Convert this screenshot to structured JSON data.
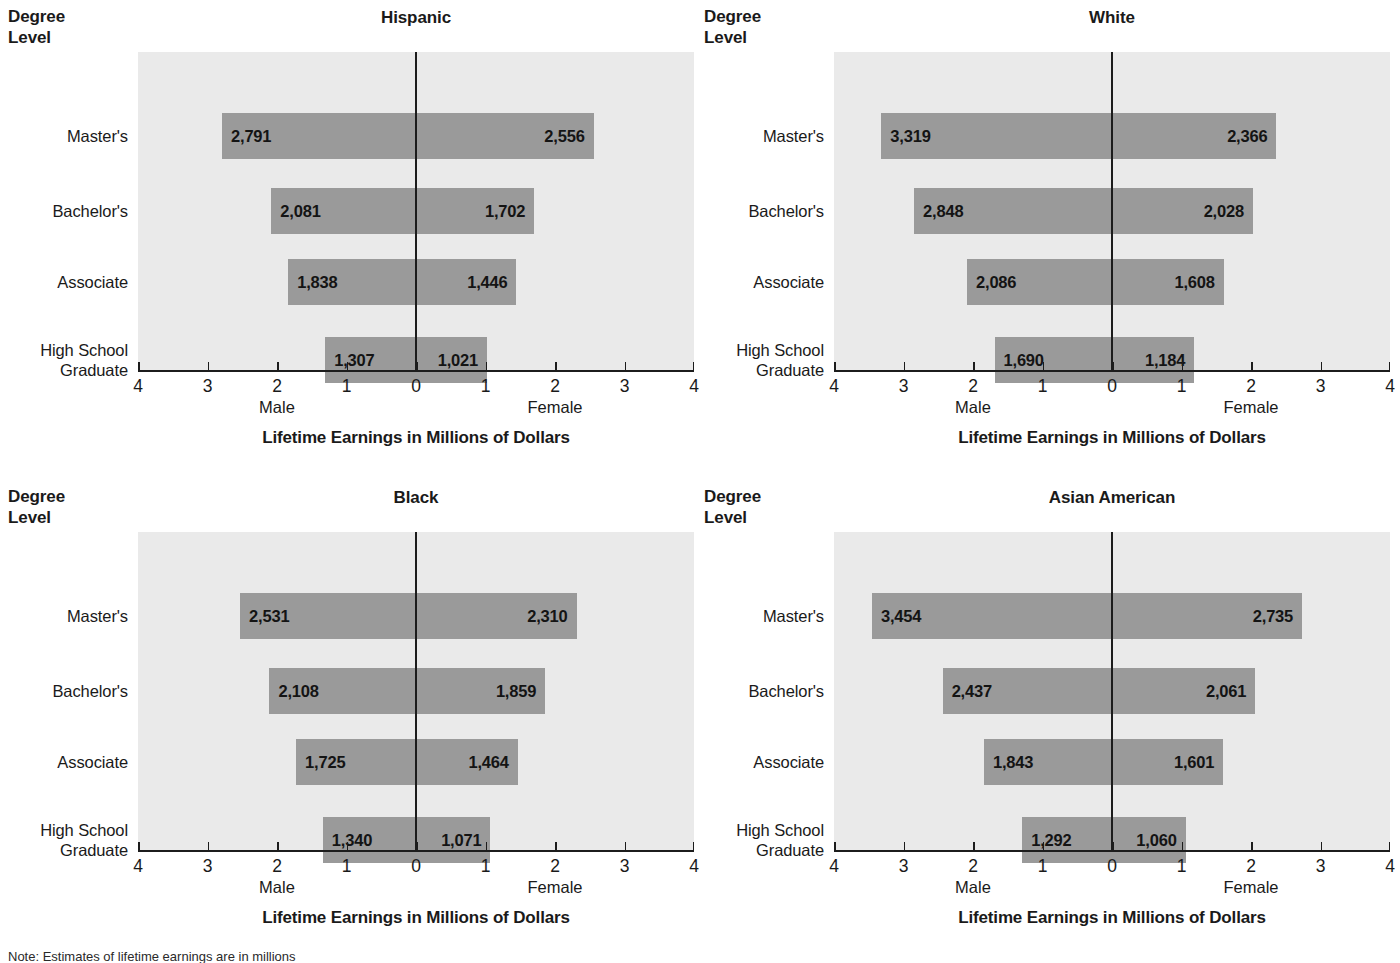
{
  "figure": {
    "stub_head_line1": "Degree",
    "stub_head_line2": "Level",
    "axis_title": "Lifetime Earnings in Millions of Dollars",
    "male_label": "Male",
    "female_label": "Female",
    "footnote": "Note: Estimates of lifetime earnings are in millions",
    "bar_color": "#9a9a9a",
    "plot_background": "#eaeaea",
    "axis_color": "#1c1c1c",
    "text_color": "#1a1a1a"
  },
  "axis": {
    "tick_labels": [
      "4",
      "3",
      "2",
      "1",
      "0",
      "1",
      "2",
      "3",
      "4"
    ],
    "tick_values": [
      -4,
      -3,
      -2,
      -1,
      0,
      1,
      2,
      3,
      4
    ],
    "min": -4,
    "max": 4
  },
  "categories": [
    {
      "label_line1": "Master's",
      "label_line2": ""
    },
    {
      "label_line1": "Bachelor's",
      "label_line2": ""
    },
    {
      "label_line1": "Associate",
      "label_line2": ""
    },
    {
      "label_line1": "High School",
      "label_line2": "Graduate"
    }
  ],
  "panels": [
    {
      "title": "Hispanic",
      "rows": [
        {
          "category": "Master's",
          "male_label": "2,791",
          "female_label": "2,556",
          "male": 2.791,
          "female": 2.556
        },
        {
          "category": "Bachelor's",
          "male_label": "2,081",
          "female_label": "1,702",
          "male": 2.081,
          "female": 1.702
        },
        {
          "category": "Associate",
          "male_label": "1,838",
          "female_label": "1,446",
          "male": 1.838,
          "female": 1.446
        },
        {
          "category": "High School Graduate",
          "male_label": "1,307",
          "female_label": "1,021",
          "male": 1.307,
          "female": 1.021
        }
      ]
    },
    {
      "title": "White",
      "rows": [
        {
          "category": "Master's",
          "male_label": "3,319",
          "female_label": "2,366",
          "male": 3.319,
          "female": 2.366
        },
        {
          "category": "Bachelor's",
          "male_label": "2,848",
          "female_label": "2,028",
          "male": 2.848,
          "female": 2.028
        },
        {
          "category": "Associate",
          "male_label": "2,086",
          "female_label": "1,608",
          "male": 2.086,
          "female": 1.608
        },
        {
          "category": "High School Graduate",
          "male_label": "1,690",
          "female_label": "1,184",
          "male": 1.69,
          "female": 1.184
        }
      ]
    },
    {
      "title": "Black",
      "rows": [
        {
          "category": "Master's",
          "male_label": "2,531",
          "female_label": "2,310",
          "male": 2.531,
          "female": 2.31
        },
        {
          "category": "Bachelor's",
          "male_label": "2,108",
          "female_label": "1,859",
          "male": 2.108,
          "female": 1.859
        },
        {
          "category": "Associate",
          "male_label": "1,725",
          "female_label": "1,464",
          "male": 1.725,
          "female": 1.464
        },
        {
          "category": "High School Graduate",
          "male_label": "1,340",
          "female_label": "1,071",
          "male": 1.34,
          "female": 1.071
        }
      ]
    },
    {
      "title": "Asian American",
      "rows": [
        {
          "category": "Master's",
          "male_label": "3,454",
          "female_label": "2,735",
          "male": 3.454,
          "female": 2.735
        },
        {
          "category": "Bachelor's",
          "male_label": "2,437",
          "female_label": "2,061",
          "male": 2.437,
          "female": 2.061
        },
        {
          "category": "Associate",
          "male_label": "1,843",
          "female_label": "1,601",
          "male": 1.843,
          "female": 1.601
        },
        {
          "category": "High School Graduate",
          "male_label": "1,292",
          "female_label": "1,060",
          "male": 1.292,
          "female": 1.06
        }
      ]
    }
  ],
  "chart_data": {
    "type": "bar",
    "subtitle": "",
    "xlabel": "Lifetime Earnings in Millions of Dollars",
    "ylabel": "Degree Level",
    "orientation": "horizontal",
    "layout": "2x2 small-multiple diverging (butterfly) bar charts",
    "grid": false,
    "legend": "none (left side = Male, right side = Female)",
    "xlim": [
      -4,
      4
    ],
    "xticks": [
      -4,
      -3,
      -2,
      -1,
      0,
      1,
      2,
      3,
      4
    ],
    "xticklabels": [
      "4",
      "3",
      "2",
      "1",
      "0",
      "1",
      "2",
      "3",
      "4"
    ],
    "categories": [
      "Master's",
      "Bachelor's",
      "Associate",
      "High School Graduate"
    ],
    "units": "millions of dollars",
    "panels": [
      {
        "name": "Hispanic",
        "series": [
          {
            "name": "Male",
            "values": [
              2.791,
              2.081,
              1.838,
              1.307
            ],
            "labels": [
              "2,791",
              "2,081",
              "1,838",
              "1,307"
            ]
          },
          {
            "name": "Female",
            "values": [
              2.556,
              1.702,
              1.446,
              1.021
            ],
            "labels": [
              "2,556",
              "1,702",
              "1,446",
              "1,021"
            ]
          }
        ]
      },
      {
        "name": "White",
        "series": [
          {
            "name": "Male",
            "values": [
              3.319,
              2.848,
              2.086,
              1.69
            ],
            "labels": [
              "3,319",
              "2,848",
              "2,086",
              "1,690"
            ]
          },
          {
            "name": "Female",
            "values": [
              2.366,
              2.028,
              1.608,
              1.184
            ],
            "labels": [
              "2,366",
              "2,028",
              "1,608",
              "1,184"
            ]
          }
        ]
      },
      {
        "name": "Black",
        "series": [
          {
            "name": "Male",
            "values": [
              2.531,
              2.108,
              1.725,
              1.34
            ],
            "labels": [
              "2,531",
              "2,108",
              "1,725",
              "1,340"
            ]
          },
          {
            "name": "Female",
            "values": [
              2.31,
              1.859,
              1.464,
              1.071
            ],
            "labels": [
              "2,310",
              "1,859",
              "1,464",
              "1,071"
            ]
          }
        ]
      },
      {
        "name": "Asian American",
        "series": [
          {
            "name": "Male",
            "values": [
              3.454,
              2.437,
              1.843,
              1.292
            ],
            "labels": [
              "3,454",
              "2,437",
              "1,843",
              "1,292"
            ]
          },
          {
            "name": "Female",
            "values": [
              2.735,
              2.061,
              1.601,
              1.06
            ],
            "labels": [
              "2,735",
              "2,061",
              "1,601",
              "1,060"
            ]
          }
        ]
      }
    ]
  }
}
